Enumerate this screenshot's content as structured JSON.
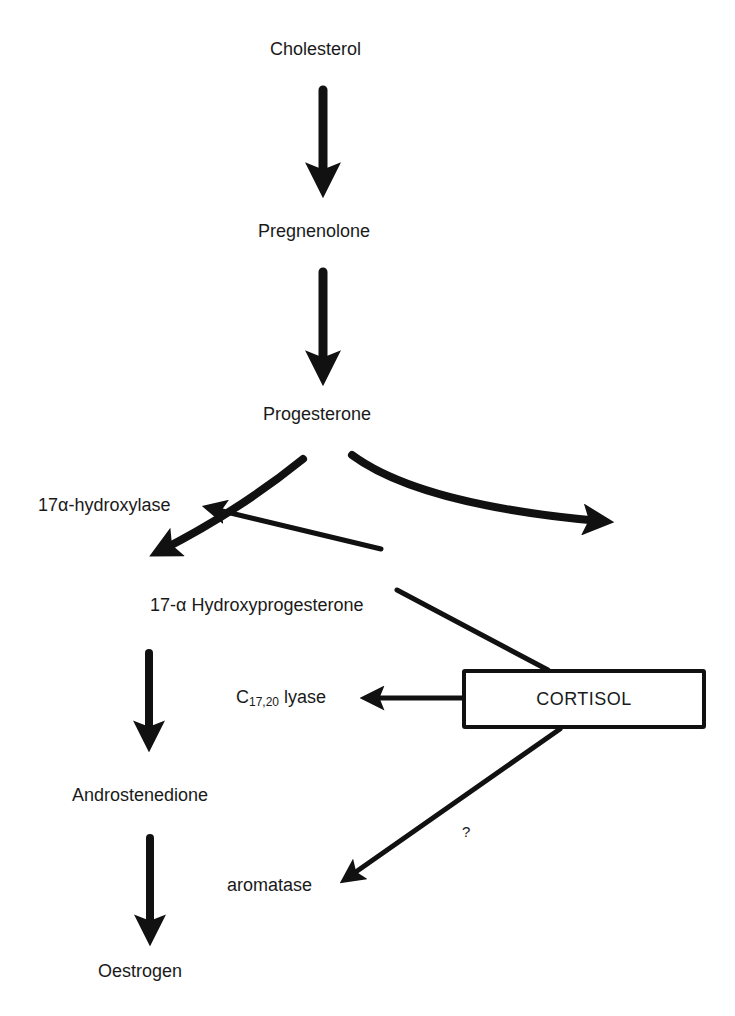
{
  "diagram": {
    "type": "biosynthesis-pathway",
    "nodes": {
      "cholesterol": "Cholesterol",
      "pregnenolone": "Pregnenolone",
      "progesterone": "Progesterone",
      "hydroxyprogesterone": "17-α Hydroxyprogesterone",
      "androstenedione": "Androstenedione",
      "oestrogen": "Oestrogen",
      "cortisol": "CORTISOL"
    },
    "enzymes": {
      "hydroxylase": "17α-hydroxylase",
      "lyase_main": "C",
      "lyase_sub": "17,20",
      "lyase_suffix": " lyase",
      "aromatase": "aromatase"
    },
    "annotations": {
      "uncertain": "?"
    },
    "edges": [
      {
        "from": "Cholesterol",
        "to": "Pregnenolone"
      },
      {
        "from": "Pregnenolone",
        "to": "Progesterone"
      },
      {
        "from": "Progesterone",
        "to": "17-α Hydroxyprogesterone"
      },
      {
        "from": "Progesterone",
        "to": "(off-diagram, right)"
      },
      {
        "from": "17-α Hydroxyprogesterone",
        "to": "Androstenedione"
      },
      {
        "from": "Androstenedione",
        "to": "Oestrogen"
      },
      {
        "from": "17-α Hydroxyprogesterone",
        "to": "CORTISOL",
        "style": "line"
      },
      {
        "from": "CORTISOL",
        "to": "17α-hydroxylase",
        "style": "inhibit-line"
      },
      {
        "from": "CORTISOL",
        "to": "C17,20 lyase"
      },
      {
        "from": "CORTISOL",
        "to": "aromatase",
        "label": "?"
      }
    ],
    "colors": {
      "ink": "#111111",
      "background": "#ffffff"
    }
  }
}
